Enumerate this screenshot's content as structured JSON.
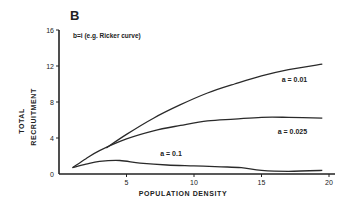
{
  "chart_data": {
    "type": "line",
    "panel_label": "B",
    "title": "",
    "subtitle": "b=i (e.g. Ricker curve)",
    "xlabel": "POPULATION DENSITY",
    "ylabel": [
      "TOTAL",
      "RECRUITMENT"
    ],
    "xlim": [
      0,
      20
    ],
    "ylim": [
      0,
      16
    ],
    "x_ticks": [
      5,
      10,
      15,
      20
    ],
    "y_ticks": [
      0,
      4,
      8,
      12,
      16
    ],
    "grid": false,
    "legend": "inline labels",
    "series": [
      {
        "name": "a=0.01",
        "label": "a=0.01",
        "x": [
          3.5,
          5,
          7,
          9,
          11,
          13,
          15,
          17,
          19.5
        ],
        "y": [
          2.9,
          4.4,
          6.2,
          7.7,
          9.0,
          10.0,
          10.9,
          11.6,
          12.2
        ]
      },
      {
        "name": "a=0.025",
        "label": "a=0.025",
        "x": [
          1,
          2,
          3,
          5,
          7,
          9,
          11,
          13,
          15,
          17,
          19.5
        ],
        "y": [
          0.7,
          1.7,
          2.6,
          3.9,
          4.8,
          5.4,
          5.9,
          6.1,
          6.3,
          6.3,
          6.2
        ]
      },
      {
        "name": "a=0.1",
        "label": "a=0.1",
        "x": [
          1,
          2,
          3,
          4.5,
          6,
          8,
          10,
          12,
          13.5,
          15,
          17,
          19.5
        ],
        "y": [
          0.7,
          1.1,
          1.4,
          1.5,
          1.2,
          1.0,
          0.9,
          0.8,
          0.7,
          0.4,
          0.3,
          0.4
        ]
      }
    ],
    "annotations": [
      {
        "text": "a=0.01",
        "x": 16.5,
        "y": 10.2
      },
      {
        "text": "a=0.025",
        "x": 16.2,
        "y": 4.5
      },
      {
        "text": "a=0.1",
        "x": 7.5,
        "y": 2.0
      }
    ]
  }
}
